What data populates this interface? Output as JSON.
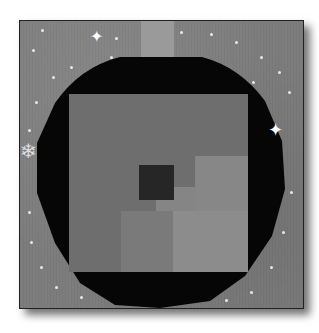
{
  "image": {
    "subject": "Quilt block depicting a Christmas ornament",
    "colors": {
      "background_fabric": "#7d7d7d",
      "ornament_frame": "#060606",
      "inner_square": "#6e6e6e",
      "inner_lighter": "#8a8a8a",
      "center_square": "#262626",
      "cap": "#9a9a9a",
      "stars": "#ffffff"
    }
  }
}
